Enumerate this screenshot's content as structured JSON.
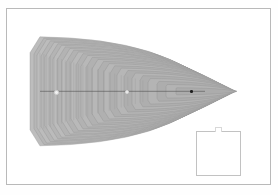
{
  "figure": {
    "title": "",
    "background_color": "#ffffff",
    "frame": {
      "name": "plot-frame",
      "x": 6,
      "y": 8,
      "width": 265,
      "height": 177,
      "border_color": "#b9b9b9",
      "border_width": 1
    },
    "inset": {
      "name": "inset-box",
      "x": 196,
      "y": 131,
      "width": 45,
      "height": 45,
      "border_color": "#c2c2c2",
      "fill": "#ffffff",
      "label": ""
    }
  },
  "chart_data": {
    "type": "line",
    "title": "",
    "subtitle": "",
    "xlabel": "",
    "ylabel": "",
    "grid": false,
    "legend": "none",
    "xlim": [
      0,
      278
    ],
    "ylim": [
      195,
      0
    ],
    "fill_color": "#adadad",
    "contour_line_color": "#8d8d8d",
    "axis_line_color": "#4a4a4a",
    "contour_count": 26,
    "axis": {
      "name": "horizontal-axis",
      "y": 91.3,
      "x_start": 40,
      "x_end": 205
    },
    "points": [
      {
        "name": "focus-left",
        "x": 55.3,
        "y": 91.3,
        "marker": "circle",
        "color": "#f2f2f2",
        "edge": "#cfcfcf",
        "size": 2.6
      },
      {
        "name": "focus-mid",
        "x": 126.2,
        "y": 91.2,
        "marker": "circle",
        "color": "#f4f4f4",
        "edge": "#d4d4d4",
        "size": 2.4
      },
      {
        "name": "focus-right",
        "x": 191.3,
        "y": 91.5,
        "marker": "circle",
        "color": "#1d1d1d",
        "edge": "#1d1d1d",
        "size": 2.6
      }
    ],
    "envelope": {
      "left_face_x": 30,
      "left_face_top_y": 52,
      "left_face_bottom_y": 130,
      "apex_top_x": 58,
      "apex_top_y": 34,
      "apex_bottom_x": 58,
      "apex_bottom_y": 148,
      "right_tip_x": 237,
      "right_tip_y": 91,
      "sawtooth_teeth": 26,
      "sawtooth_depth": 3.2
    },
    "series": [
      {
        "name": "contour-01",
        "vertex_x": 191.3,
        "half_height": 3.5,
        "left_x": 176
      },
      {
        "name": "contour-02",
        "vertex_x": 191.3,
        "half_height": 6.8,
        "left_x": 166
      },
      {
        "name": "contour-03",
        "vertex_x": 191.3,
        "half_height": 9.9,
        "left_x": 157
      },
      {
        "name": "contour-04",
        "vertex_x": 191.3,
        "half_height": 12.8,
        "left_x": 148
      },
      {
        "name": "contour-05",
        "vertex_x": 191.3,
        "half_height": 15.6,
        "left_x": 140
      },
      {
        "name": "contour-06",
        "vertex_x": 191.3,
        "half_height": 18.3,
        "left_x": 132
      },
      {
        "name": "contour-07",
        "vertex_x": 191.3,
        "half_height": 20.8,
        "left_x": 124
      },
      {
        "name": "contour-08",
        "vertex_x": 191.3,
        "half_height": 23.2,
        "left_x": 117
      },
      {
        "name": "contour-09",
        "vertex_x": 191.3,
        "half_height": 25.5,
        "left_x": 110
      },
      {
        "name": "contour-10",
        "vertex_x": 191.3,
        "half_height": 27.7,
        "left_x": 104
      },
      {
        "name": "contour-11",
        "vertex_x": 191.3,
        "half_height": 29.9,
        "left_x": 98
      },
      {
        "name": "contour-12",
        "vertex_x": 191.3,
        "half_height": 31.9,
        "left_x": 92
      },
      {
        "name": "contour-13",
        "vertex_x": 191.3,
        "half_height": 33.9,
        "left_x": 86
      },
      {
        "name": "contour-14",
        "vertex_x": 191.3,
        "half_height": 35.8,
        "left_x": 81
      },
      {
        "name": "contour-15",
        "vertex_x": 191.3,
        "half_height": 37.6,
        "left_x": 76
      },
      {
        "name": "contour-16",
        "vertex_x": 191.3,
        "half_height": 39.4,
        "left_x": 71
      },
      {
        "name": "contour-17",
        "vertex_x": 191.3,
        "half_height": 41.1,
        "left_x": 66
      },
      {
        "name": "contour-18",
        "vertex_x": 191.3,
        "half_height": 42.8,
        "left_x": 62
      },
      {
        "name": "contour-19",
        "vertex_x": 191.3,
        "half_height": 44.4,
        "left_x": 57
      },
      {
        "name": "contour-20",
        "vertex_x": 191.3,
        "half_height": 46.0,
        "left_x": 53
      },
      {
        "name": "contour-21",
        "vertex_x": 191.3,
        "half_height": 47.5,
        "left_x": 49
      },
      {
        "name": "contour-22",
        "vertex_x": 191.3,
        "half_height": 49.0,
        "left_x": 45
      },
      {
        "name": "contour-23",
        "vertex_x": 191.3,
        "half_height": 50.4,
        "left_x": 41
      },
      {
        "name": "contour-24",
        "vertex_x": 191.3,
        "half_height": 51.8,
        "left_x": 37
      },
      {
        "name": "contour-25",
        "vertex_x": 191.3,
        "half_height": 53.2,
        "left_x": 34
      },
      {
        "name": "contour-26",
        "vertex_x": 191.3,
        "half_height": 54.5,
        "left_x": 30
      }
    ]
  }
}
